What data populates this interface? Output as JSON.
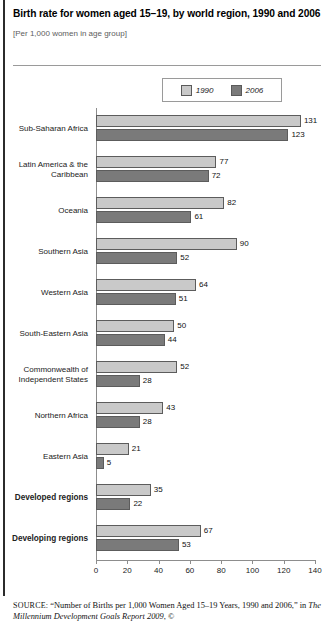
{
  "header": {
    "title": "Birth rate for women aged 15–19, by world region, 1990 and 2006",
    "subtitle": "[Per 1,000 women in age group]"
  },
  "legend": {
    "items": [
      {
        "label": "1990",
        "color": "#c9c9c9"
      },
      {
        "label": "2006",
        "color": "#7a7a7a"
      }
    ]
  },
  "source": {
    "prefix": "SOURCE:",
    "line1": "“Number of Births per 1,000 Women Aged 15–19 Years, 1990",
    "line2_pre": "and 2006,” in ",
    "line2_em": "The Millennium Development Goals Report 2009",
    "line2_post": ", ©"
  },
  "chart_data": {
    "type": "bar",
    "orientation": "horizontal",
    "title": "Birth rate for women aged 15–19, by world region, 1990 and 2006",
    "subtitle": "[Per 1,000 women in age group]",
    "xlabel": "",
    "ylabel": "",
    "xlim": [
      0,
      140
    ],
    "xticks": [
      0,
      20,
      40,
      60,
      80,
      100,
      120,
      140
    ],
    "grid": false,
    "legend_position": "top-center",
    "categories": [
      "Sub-Saharan Africa",
      "Latin America & the Caribbean",
      "Oceania",
      "Southern Asia",
      "Western Asia",
      "South-Eastern Asia",
      "Commonwealth of Independent States",
      "Northern Africa",
      "Eastern Asia",
      "Developed regions",
      "Developing regions"
    ],
    "category_lines": [
      [
        "Sub-Saharan Africa"
      ],
      [
        "Latin America & the",
        "Caribbean"
      ],
      [
        "Oceania"
      ],
      [
        "Southern Asia"
      ],
      [
        "Western Asia"
      ],
      [
        "South-Eastern Asia"
      ],
      [
        "Commonwealth of",
        "Independent States"
      ],
      [
        "Northern Africa"
      ],
      [
        "Eastern Asia"
      ],
      [
        "Developed regions"
      ],
      [
        "Developing regions"
      ]
    ],
    "emphasis": [
      false,
      false,
      false,
      false,
      false,
      false,
      false,
      false,
      false,
      true,
      true
    ],
    "series": [
      {
        "name": "1990",
        "color": "#c9c9c9",
        "values": [
          131,
          77,
          82,
          90,
          64,
          50,
          52,
          43,
          21,
          35,
          67
        ]
      },
      {
        "name": "2006",
        "color": "#7a7a7a",
        "values": [
          123,
          72,
          61,
          52,
          51,
          44,
          28,
          28,
          5,
          22,
          53
        ]
      }
    ]
  }
}
